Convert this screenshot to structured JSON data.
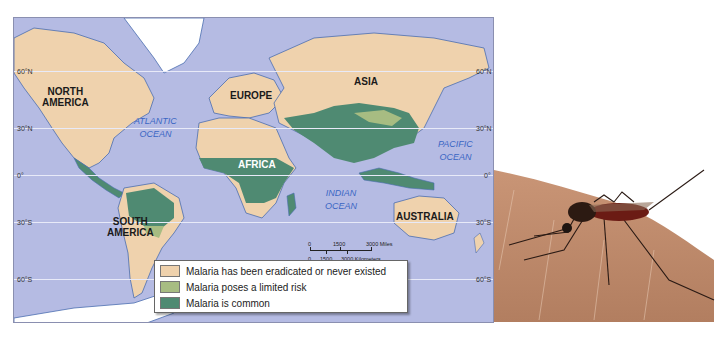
{
  "map": {
    "latitude_labels": {
      "n60_left": "60°N",
      "n30_left": "30°N",
      "eq_left": "0°",
      "s30_left": "30°S",
      "s60_left": "60°S",
      "n60_right": "60°N",
      "n30_right": "30°N",
      "eq_right": "0°",
      "s30_right": "30°S",
      "s60_right": "60°S"
    },
    "continents": {
      "north_america": "NORTH\nAMERICA",
      "south_america": "SOUTH\nAMERICA",
      "europe": "EUROPE",
      "asia": "ASIA",
      "africa": "AFRICA",
      "australia": "AUSTRALIA"
    },
    "oceans": {
      "atlantic": "ATLANTIC\nOCEAN",
      "pacific": "PACIFIC\nOCEAN",
      "indian": "INDIAN\nOCEAN"
    },
    "scale": {
      "miles_0": "0",
      "miles_1500": "1500",
      "miles_3000": "3000 Miles",
      "km_0": "0",
      "km_1500": "1500",
      "km_3000": "3000 Kilometers"
    },
    "colors": {
      "ocean": "#b5bbe3",
      "eradicated": "#efd2ad",
      "limited": "#a7bc82",
      "common": "#4f8a72",
      "ice": "#ffffff"
    }
  },
  "legend": {
    "items": [
      {
        "label": "Malaria has been eradicated or never existed",
        "color": "#efd2ad"
      },
      {
        "label": "Malaria poses a limited risk",
        "color": "#a7bc82"
      },
      {
        "label": "Malaria is common",
        "color": "#4f8a72"
      }
    ]
  },
  "photo": {
    "subject": "mosquito-on-skin"
  }
}
